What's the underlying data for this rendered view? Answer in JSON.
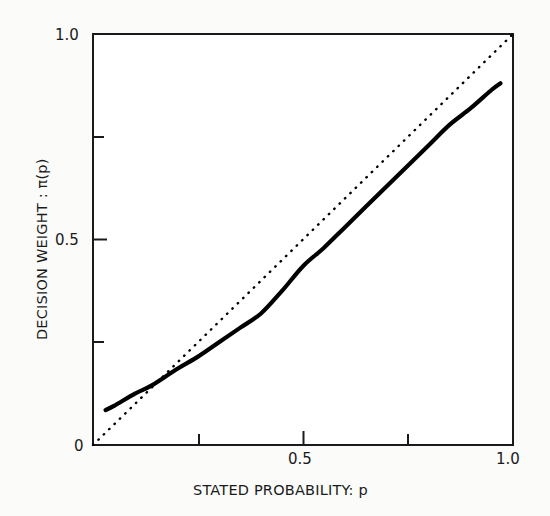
{
  "chart_data": {
    "type": "line",
    "title": "",
    "xlabel": "STATED PROBABILITY: p",
    "ylabel": "DECISION WEIGHT : π(p)",
    "xlim": [
      0,
      1.0
    ],
    "ylim": [
      0,
      1.0
    ],
    "grid": false,
    "legend": "none",
    "x_major_ticks": [
      0,
      0.5,
      1.0
    ],
    "x_major_tick_labels": [
      "0",
      "0.5",
      "1.0"
    ],
    "x_minor_ticks": [
      0.25,
      0.75
    ],
    "y_major_ticks": [
      0,
      0.5,
      1.0
    ],
    "y_major_tick_labels": [
      "0",
      "0.5",
      "1.0"
    ],
    "y_minor_ticks": [
      0.25,
      0.75
    ],
    "series": [
      {
        "name": "identity line",
        "style": "dotted",
        "color": "#000000",
        "x": [
          0.0,
          1.0
        ],
        "values": [
          0.0,
          1.0
        ]
      },
      {
        "name": "decision weight function",
        "style": "solid",
        "color": "#000000",
        "x": [
          0.03,
          0.05,
          0.1,
          0.14,
          0.2,
          0.25,
          0.3,
          0.35,
          0.4,
          0.45,
          0.5,
          0.55,
          0.6,
          0.65,
          0.7,
          0.75,
          0.8,
          0.85,
          0.9,
          0.95,
          0.97
        ],
        "values": [
          0.085,
          0.095,
          0.125,
          0.145,
          0.185,
          0.215,
          0.25,
          0.285,
          0.32,
          0.375,
          0.435,
          0.48,
          0.53,
          0.58,
          0.63,
          0.68,
          0.73,
          0.78,
          0.82,
          0.865,
          0.88
        ]
      }
    ],
    "annotations": []
  },
  "axes": {
    "y_title": "DECISION WEIGHT : π(p)",
    "x_title": "STATED PROBABILITY: p",
    "y_labels": {
      "top": "1.0",
      "middle": "0.5",
      "bottom": "0"
    },
    "x_labels": {
      "left": "0",
      "middle": "0.5",
      "right": "1.0"
    }
  }
}
